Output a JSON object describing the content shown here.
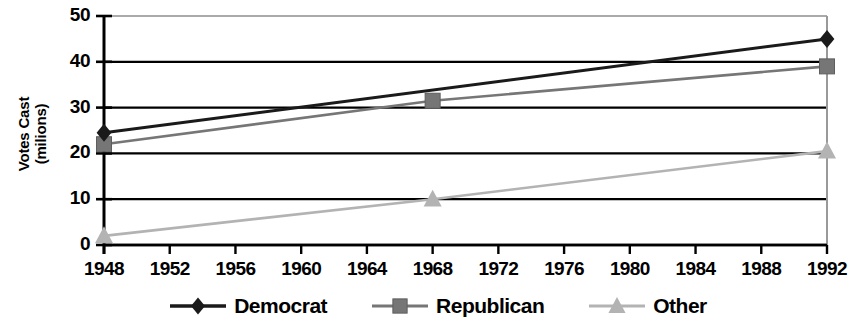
{
  "chart_data": {
    "type": "line",
    "title": "",
    "subtitle": "",
    "xlabel": "",
    "ylabel": "Votes Cast (milions)",
    "ylabel_line1": "Votes Cast",
    "ylabel_line2": "(milions)",
    "x": [
      1948,
      1952,
      1956,
      1960,
      1964,
      1968,
      1972,
      1976,
      1980,
      1984,
      1988,
      1992
    ],
    "xtick_labels": [
      "1948",
      "1952",
      "1956",
      "1960",
      "1964",
      "1968",
      "1972",
      "1976",
      "1980",
      "1984",
      "1988",
      "1992"
    ],
    "ytick_labels": [
      "0",
      "10",
      "20",
      "30",
      "40",
      "50"
    ],
    "yticks": [
      0,
      10,
      20,
      30,
      40,
      50
    ],
    "xlim": [
      1948,
      1992
    ],
    "ylim": [
      0,
      50
    ],
    "grid": "horizontal",
    "legend_position": "bottom",
    "series": [
      {
        "name": "Democrat",
        "color": "#1a1a1a",
        "marker": "diamond",
        "points": [
          {
            "x": 1948,
            "y": 24.5
          },
          {
            "x": 1992,
            "y": 45
          }
        ]
      },
      {
        "name": "Republican",
        "color": "#767676",
        "marker": "square",
        "points": [
          {
            "x": 1948,
            "y": 22
          },
          {
            "x": 1968,
            "y": 31.5
          },
          {
            "x": 1992,
            "y": 39
          }
        ]
      },
      {
        "name": "Other",
        "color": "#b3b3b3",
        "marker": "triangle",
        "points": [
          {
            "x": 1948,
            "y": 2
          },
          {
            "x": 1968,
            "y": 10
          },
          {
            "x": 1992,
            "y": 20.5
          }
        ]
      }
    ]
  },
  "legend": {
    "entries": [
      {
        "label": "Democrat",
        "color": "#1a1a1a",
        "marker": "diamond"
      },
      {
        "label": "Republican",
        "color": "#767676",
        "marker": "square"
      },
      {
        "label": "Other",
        "color": "#b3b3b3",
        "marker": "triangle"
      }
    ]
  },
  "axes": {
    "y_title_line1": "Votes Cast",
    "y_title_line2": "(milions)"
  }
}
